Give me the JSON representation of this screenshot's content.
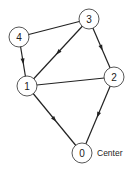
{
  "diagram": {
    "type": "directed-graph",
    "nodes": [
      {
        "id": "0",
        "label": "0",
        "x": 82,
        "y": 153,
        "r": 10
      },
      {
        "id": "1",
        "label": "1",
        "x": 27,
        "y": 86,
        "r": 10
      },
      {
        "id": "2",
        "label": "2",
        "x": 114,
        "y": 77,
        "r": 10
      },
      {
        "id": "3",
        "label": "3",
        "x": 89,
        "y": 19,
        "r": 10
      },
      {
        "id": "4",
        "label": "4",
        "x": 19,
        "y": 37,
        "r": 10
      }
    ],
    "edges": [
      {
        "from": "4",
        "to": "3",
        "directed": false
      },
      {
        "from": "4",
        "to": "1",
        "directed": true
      },
      {
        "from": "3",
        "to": "1",
        "directed": true
      },
      {
        "from": "3",
        "to": "2",
        "directed": true
      },
      {
        "from": "1",
        "to": "2",
        "directed": false
      },
      {
        "from": "1",
        "to": "0",
        "directed": true
      },
      {
        "from": "2",
        "to": "0",
        "directed": true
      }
    ],
    "annotation": {
      "text": "Center",
      "attached_to": "0",
      "x": 97,
      "y": 153
    },
    "colors": {
      "line": "#222222",
      "node_stroke": "#444444",
      "background": "#ffffff"
    }
  }
}
